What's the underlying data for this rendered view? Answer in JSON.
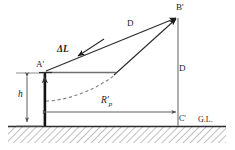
{
  "figure": {
    "ground_line_label": "G.L.",
    "colors": {
      "line": "#4d4d4d",
      "line_dark": "#1a1a1a",
      "pole": "#111111",
      "dashed_curve": "#777777",
      "hatch": "#8a8a8a",
      "label_text": "#1a1a1a",
      "background": "#ffffff"
    }
  },
  "points": {
    "a_prime": "A'",
    "b_prime": "B'",
    "c_prime": "C'"
  },
  "labels": {
    "distance_slant": "D",
    "distance_vertical": "D",
    "delta_l": "ΔL",
    "height": "h",
    "radius_r": "R",
    "radius_r_sub": "p",
    "radius_r_prime": "R'",
    "ground": "G.L."
  },
  "geometry": {
    "pole_x": 45,
    "pole_top_y": 72,
    "pole_bottom_y": 126,
    "ground_y": 126,
    "b_prime_x": 178,
    "b_prime_y": 16,
    "c_prime_x": 178,
    "c_prime_y": 126,
    "height_dim_x": 27,
    "radius_dim_y": 112,
    "hatch_left": 8,
    "hatch_right": 226,
    "hatch_bottom": 143
  },
  "elements": [
    {
      "name": "pole",
      "type": "vertical-bar",
      "desc": "vertical mast of height h at A'"
    },
    {
      "name": "slant-line-d",
      "type": "arrow",
      "desc": "line D from A' up-right to B'"
    },
    {
      "name": "delta-l-arrow",
      "type": "arrow",
      "desc": "ΔL arrow pointing back toward A'"
    },
    {
      "name": "curve-line",
      "type": "arrow",
      "desc": "second line from curve end up to B'"
    },
    {
      "name": "trajectory-curve",
      "type": "dashed-curve",
      "desc": "dashed curved trajectory from pole base"
    },
    {
      "name": "horizontal-ref-line",
      "type": "line",
      "desc": "horizontal line from A' to curve end"
    },
    {
      "name": "vertical-dim-d",
      "type": "line",
      "desc": "vertical distance D from B' down to C'"
    },
    {
      "name": "height-dim",
      "type": "dimension",
      "desc": "double-arrow dimension for h"
    },
    {
      "name": "radius-dim",
      "type": "dimension",
      "desc": "double-arrow dimension for R'p"
    },
    {
      "name": "ground-line",
      "type": "line",
      "desc": "ground level line G.L."
    },
    {
      "name": "ground-hatch",
      "type": "hatch",
      "desc": "diagonal hatching below ground"
    }
  ]
}
